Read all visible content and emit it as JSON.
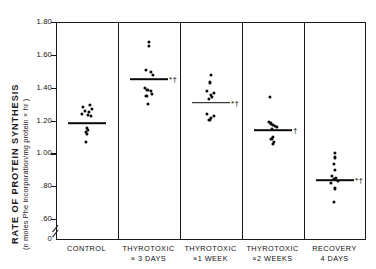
{
  "chart_data": {
    "type": "scatter",
    "title": "",
    "xlabel": "",
    "ylabel": "RATE OF PROTEIN SYNTHESIS",
    "ylabel_units": "(n moles  Phe incorporation/mg protein × hr )",
    "ylim": [
      0.5,
      1.8
    ],
    "yticks": [
      0.6,
      0.8,
      1.0,
      1.2,
      1.4,
      1.6,
      1.8
    ],
    "ytick_labels": [
      ".60",
      ".80",
      "1.00",
      "1.20",
      "1.40",
      "1.60",
      "1.80"
    ],
    "y_origin_label": "0",
    "axis_break": true,
    "grid": false,
    "legend": null,
    "significance_key": {
      "asterisk": "*",
      "dagger": "†"
    },
    "categories": [
      {
        "line1": "CONTROL",
        "line2": ""
      },
      {
        "line1": "THYROTOXIC",
        "line2": "× 3 DAYS"
      },
      {
        "line1": "THYROTOXIC",
        "line2": "×1  WEEK"
      },
      {
        "line1": "THYROTOXIC",
        "line2": "×2 WEEKS"
      },
      {
        "line1": "RECOVERY",
        "line2": "4  DAYS"
      }
    ],
    "groups": [
      {
        "name": "CONTROL",
        "mean": 1.185,
        "significance": "",
        "values": [
          1.295,
          1.285,
          1.27,
          1.258,
          1.25,
          1.24,
          1.232,
          1.225,
          1.155,
          1.14,
          1.128,
          1.118,
          1.072
        ],
        "jitter": [
          0.3,
          -0.25,
          0.42,
          -0.1,
          0.22,
          -0.38,
          0.12,
          0.34,
          0.0,
          0.08,
          -0.06,
          0.04,
          -0.02
        ]
      },
      {
        "name": "THYROTOXIC × 3 DAYS",
        "mean": 1.452,
        "significance": "*†",
        "values": [
          1.68,
          1.652,
          1.508,
          1.495,
          1.478,
          1.398,
          1.388,
          1.378,
          1.362,
          1.352,
          1.3
        ],
        "jitter": [
          0.0,
          0.02,
          -0.22,
          0.18,
          0.36,
          -0.3,
          -0.08,
          0.16,
          0.3,
          -0.16,
          -0.04
        ]
      },
      {
        "name": "THYROTOXIC ×1 WEEK",
        "mean": 1.308,
        "significance": "*†",
        "values": [
          1.48,
          1.432,
          1.378,
          1.368,
          1.358,
          1.342,
          1.33,
          1.238,
          1.228,
          1.218,
          1.205
        ],
        "jitter": [
          0.02,
          -0.04,
          -0.26,
          0.24,
          0.0,
          0.1,
          -0.12,
          -0.24,
          0.26,
          0.02,
          -0.08
        ]
      },
      {
        "name": "THYROTOXIC ×2 WEEKS",
        "mean": 1.142,
        "significance": "†",
        "values": [
          1.342,
          1.19,
          1.182,
          1.172,
          1.165,
          1.158,
          1.15,
          1.098,
          1.085,
          1.072,
          1.058
        ],
        "jitter": [
          -0.18,
          -0.3,
          -0.12,
          0.06,
          0.22,
          0.36,
          -0.02,
          0.04,
          -0.08,
          0.08,
          0.0
        ]
      },
      {
        "name": "RECOVERY 4 DAYS",
        "mean": 0.838,
        "significance": "*†",
        "values": [
          1.005,
          0.975,
          0.938,
          0.898,
          0.862,
          0.852,
          0.842,
          0.832,
          0.822,
          0.786,
          0.702
        ],
        "jitter": [
          0.0,
          0.02,
          -0.02,
          0.0,
          -0.18,
          0.14,
          -0.06,
          0.24,
          -0.26,
          0.02,
          -0.04
        ]
      }
    ]
  }
}
